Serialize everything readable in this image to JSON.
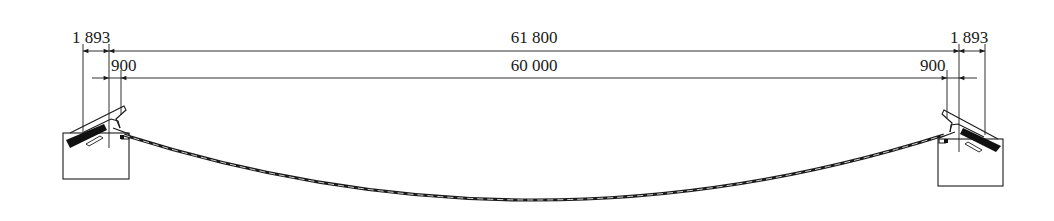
{
  "figure": {
    "type": "engineering elevation drawing"
  },
  "dimensions": {
    "overall": {
      "label": "61 800",
      "value": 61800
    },
    "clear_span": {
      "label": "60 000",
      "value": 60000
    },
    "left_outer": {
      "label": "1 893",
      "value": 1893
    },
    "right_outer": {
      "label": "1 893",
      "value": 1893
    },
    "left_inner": {
      "label": "900",
      "value": 900
    },
    "right_inner": {
      "label": "900",
      "value": 900
    }
  },
  "colors": {
    "line": "#1a1a1a",
    "background": "#ffffff"
  }
}
